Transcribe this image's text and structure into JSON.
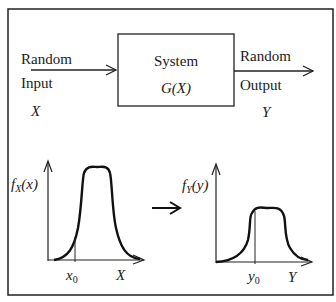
{
  "diagram": {
    "input": {
      "line1": "Random",
      "line2": "Input",
      "symbol": "X"
    },
    "system": {
      "title": "System",
      "function": "G(X)"
    },
    "output": {
      "line1": "Random",
      "line2": "Output",
      "symbol": "Y"
    },
    "input_pdf": {
      "f": "f",
      "sub": "X",
      "arg": "(x)",
      "marker": "x",
      "marker_sub": "0",
      "axis": "X"
    },
    "output_pdf": {
      "f": "f",
      "sub": "Y",
      "arg": "(y)",
      "marker": "y",
      "marker_sub": "0",
      "axis": "Y"
    },
    "transform_arrow": "→"
  }
}
